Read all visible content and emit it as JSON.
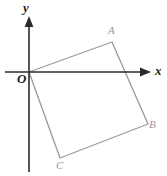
{
  "figure": {
    "background_color": "#ffffff",
    "axis_color": "#2b2b2b",
    "shape_color": "#9a9a9a",
    "axes": {
      "x_axis": {
        "label": "x",
        "icon": "arrow-right-icon",
        "start": [
          5,
          72
        ],
        "end": [
          151,
          72
        ]
      },
      "y_axis": {
        "label": "y",
        "icon": "arrow-up-icon",
        "start": [
          29,
          172
        ],
        "end": [
          29,
          17
        ]
      },
      "origin_label": "O",
      "origin": [
        29,
        72
      ]
    },
    "quadrilateral": {
      "name": "square-OABC",
      "vertices": [
        {
          "label": "O",
          "x": 29,
          "y": 72
        },
        {
          "label": "A",
          "x": 112,
          "y": 42
        },
        {
          "label": "B",
          "x": 148,
          "y": 124
        },
        {
          "label": "C",
          "x": 60,
          "y": 158
        }
      ],
      "stroke_width": 1.3
    }
  }
}
